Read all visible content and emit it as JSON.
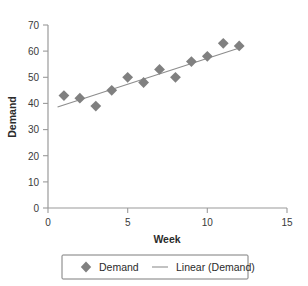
{
  "chart_data": {
    "type": "scatter",
    "title": "",
    "xlabel": "Week",
    "ylabel": "Demand",
    "xlim": [
      0,
      15
    ],
    "ylim": [
      0,
      70
    ],
    "xticks": [
      0,
      5,
      10,
      15
    ],
    "yticks": [
      0,
      10,
      20,
      30,
      40,
      50,
      60,
      70
    ],
    "grid": false,
    "legend_position": "bottom",
    "x": [
      1,
      2,
      3,
      4,
      5,
      6,
      7,
      8,
      9,
      10,
      11,
      12
    ],
    "series": [
      {
        "name": "Demand",
        "marker": "diamond",
        "color": "#808080",
        "values": [
          43,
          42,
          39,
          45,
          50,
          48,
          53,
          50,
          56,
          58,
          63,
          62
        ]
      },
      {
        "name": "Linear (Demand)",
        "marker": "line",
        "color": "#8d8d8d",
        "trend_from": [
          0.6,
          38.6
        ],
        "trend_to": [
          12.2,
          61.6
        ]
      }
    ]
  },
  "legend": {
    "entries": [
      {
        "label": "Demand",
        "symbol": "diamond-marker"
      },
      {
        "label": "Linear (Demand)",
        "symbol": "line-marker"
      }
    ]
  },
  "axes": {
    "x_title": "Week",
    "y_title": "Demand",
    "x_tick_labels": [
      "0",
      "5",
      "10",
      "15"
    ],
    "y_tick_labels": [
      "0",
      "10",
      "20",
      "30",
      "40",
      "50",
      "60",
      "70"
    ]
  },
  "colors": {
    "marker": "#808080",
    "trendline": "#8d8d8d",
    "axis": "#9a9a9a",
    "text": "#2b2b2b",
    "background": "#ffffff"
  }
}
